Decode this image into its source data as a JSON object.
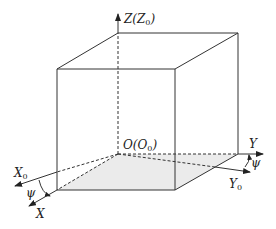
{
  "diagram": {
    "labels": {
      "z_axis": "Z(Z",
      "z_axis_sub": "0",
      "z_axis_close": ")",
      "origin": "O(O",
      "origin_sub": "0",
      "origin_close": ")",
      "x0": "X",
      "x0_sub": "0",
      "x": "X",
      "y": "Y",
      "y0": "Y",
      "y0_sub": "0",
      "psi_left": "ψ",
      "psi_right": "ψ"
    },
    "colors": {
      "stroke": "#333333",
      "floor_fill": "#ebebeb",
      "background": "#ffffff"
    }
  }
}
